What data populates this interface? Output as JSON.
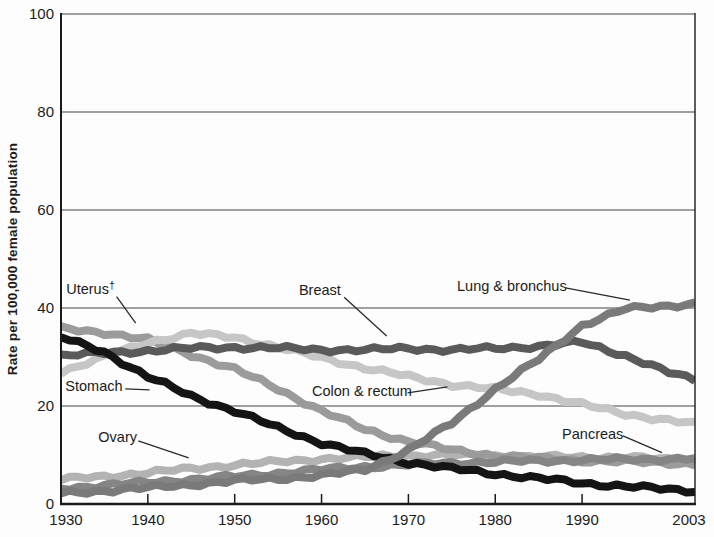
{
  "chart_data": {
    "type": "line",
    "title": "",
    "xlabel": "",
    "ylabel": "Rate per 100,000 female population",
    "xlim": [
      1930,
      2003
    ],
    "ylim": [
      0,
      100
    ],
    "yticks": [
      0,
      20,
      40,
      60,
      80,
      100
    ],
    "xticks": [
      1930,
      1940,
      1950,
      1960,
      1970,
      1980,
      1990,
      2003
    ],
    "grid": "horizontal",
    "legend_position": "inline-annotations",
    "background_color": "#fdfdfd",
    "axis_color": "#1a1a1a",
    "gridline_color": "#444444",
    "x": [
      1930,
      1935,
      1940,
      1945,
      1950,
      1955,
      1960,
      1965,
      1970,
      1975,
      1980,
      1985,
      1990,
      1995,
      2000,
      2003
    ],
    "series": [
      {
        "name": "Ovary",
        "color": "#b3b3b3",
        "values": [
          5.0,
          5.6,
          6.4,
          7.2,
          8.0,
          8.6,
          9.2,
          9.6,
          9.9,
          10.0,
          9.8,
          9.6,
          9.5,
          9.6,
          9.0,
          8.7
        ]
      },
      {
        "name": "Uterus†",
        "color": "#9b9b9b",
        "values": [
          35.8,
          35.0,
          33.5,
          30.5,
          27.5,
          23.5,
          19.0,
          15.2,
          12.8,
          11.0,
          9.9,
          9.3,
          8.9,
          8.6,
          8.4,
          8.2
        ]
      },
      {
        "name": "Pancreas",
        "color": "#858585",
        "values": [
          3.2,
          3.8,
          4.4,
          5.0,
          5.6,
          6.3,
          7.0,
          7.6,
          8.0,
          8.4,
          8.6,
          8.8,
          9.0,
          9.1,
          9.2,
          9.3
        ]
      },
      {
        "name": "Colon & rectum",
        "color": "#c6c6c6",
        "values": [
          27.0,
          30.0,
          33.0,
          34.8,
          34.0,
          32.0,
          29.8,
          27.8,
          26.0,
          24.4,
          23.4,
          22.4,
          20.3,
          18.4,
          17.0,
          16.3
        ]
      },
      {
        "name": "Breast",
        "color": "#5a5a5a",
        "values": [
          30.3,
          30.8,
          31.3,
          31.8,
          32.0,
          31.8,
          31.5,
          31.4,
          31.8,
          31.4,
          31.8,
          32.2,
          33.0,
          30.3,
          26.8,
          25.4
        ]
      },
      {
        "name": "Stomach",
        "color": "#141414",
        "values": [
          34.0,
          31.0,
          26.0,
          22.0,
          19.0,
          15.5,
          12.5,
          10.2,
          8.5,
          7.2,
          6.2,
          5.2,
          4.3,
          3.6,
          3.0,
          2.7
        ]
      },
      {
        "name": "Lung & bronchus",
        "color": "#7a7a7a",
        "values": [
          2.2,
          2.7,
          3.3,
          4.0,
          4.7,
          5.2,
          5.8,
          7.0,
          11.0,
          16.5,
          23.5,
          29.5,
          36.5,
          39.8,
          40.5,
          40.9
        ]
      }
    ],
    "annotations": [
      {
        "label": "Uterus",
        "sup": "†",
        "tx": 1930.6,
        "tv": 45.3,
        "lx1": 1936.4,
        "lv1": 42.3,
        "lx2": 1938.6,
        "lv2": 36.9
      },
      {
        "label": "Stomach",
        "tx": 1930.5,
        "tv": 25.5,
        "lx1": 1937.4,
        "lv1": 23.5,
        "lx2": 1940.2,
        "lv2": 23.3
      },
      {
        "label": "Breast",
        "tx": 1957.4,
        "tv": 45.1,
        "lx1": 1962.6,
        "lv1": 42.2,
        "lx2": 1967.5,
        "lv2": 34.3
      },
      {
        "label": "Lung & bronchus",
        "tx": 1975.6,
        "tv": 45.9,
        "lx1": 1988.1,
        "lv1": 44.1,
        "lx2": 1995.5,
        "lv2": 41.6
      },
      {
        "label": "Colon & rectum",
        "tx": 1958.9,
        "tv": 24.5,
        "lx1": 1969.9,
        "lv1": 22.7,
        "lx2": 1974.5,
        "lv2": 23.9
      },
      {
        "label": "Ovary",
        "tx": 1934.3,
        "tv": 15.1,
        "lx1": 1938.9,
        "lv1": 12.9,
        "lx2": 1944.7,
        "lv2": 9.4
      },
      {
        "label": "Pancreas",
        "tx": 1987.7,
        "tv": 15.7,
        "lx1": 1994.7,
        "lv1": 13.9,
        "lx2": 1999.2,
        "lv2": 10.5
      }
    ]
  }
}
